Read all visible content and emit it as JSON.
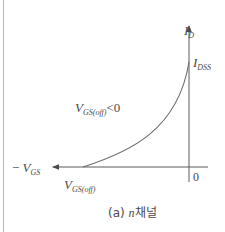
{
  "diagram": {
    "type": "transfer-characteristic",
    "colors": {
      "line": "#5a5a5a",
      "text": "#4a4a4a",
      "frame": "#b8b8b8",
      "background": "#ffffff"
    },
    "axes": {
      "y_axis": {
        "label_main": "I",
        "label_sub": "D"
      },
      "x_axis": {
        "label_prefix": "− ",
        "label_main": "V",
        "label_sub": "GS"
      },
      "origin_label": "0"
    },
    "labels": {
      "idss": {
        "main": "I",
        "sub": "DSS"
      },
      "vgs_off": {
        "main": "V",
        "sub": "GS(off)"
      },
      "condition": {
        "main": "V",
        "sub": "GS(off)",
        "suffix": "<0"
      }
    },
    "curve": {
      "description": "Square-law curve from V_GS(off) on the -V_GS axis rising to I_DSS on the I_D axis",
      "start_point": "V_GS(off)",
      "end_point": "I_DSS"
    },
    "caption": {
      "prefix": "(a) ",
      "italic": "n",
      "suffix": "채널"
    }
  }
}
